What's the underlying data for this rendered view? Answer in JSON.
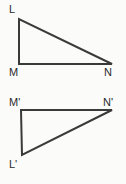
{
  "figure": {
    "background_color": "#fbfbfa",
    "stroke_color": "#3a3a3a",
    "label_color": "#2b2b2b",
    "stroke_width": 2,
    "shapes": [
      {
        "name": "triangle-lmn",
        "vertices": [
          {
            "label": "L",
            "x": 19,
            "y": 19
          },
          {
            "label": "M",
            "x": 19,
            "y": 64
          },
          {
            "label": "N",
            "x": 112,
            "y": 64
          }
        ],
        "points_attr": "19,19 19,64 112,64"
      },
      {
        "name": "triangle-lmn-prime",
        "vertices": [
          {
            "label": "M'",
            "x": 21,
            "y": 110
          },
          {
            "label": "N'",
            "x": 112,
            "y": 110
          },
          {
            "label": "L'",
            "x": 22,
            "y": 155
          }
        ],
        "points_attr": "21,110 112,110 22,155"
      }
    ],
    "labels": {
      "L": "L",
      "M": "M",
      "N": "N",
      "M_prime": "M'",
      "N_prime": "N'",
      "L_prime": "L'"
    }
  }
}
